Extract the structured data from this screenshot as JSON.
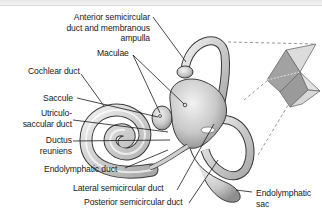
{
  "figure": {
    "labels": {
      "anterior": [
        "Anterior semicircular",
        "duct and membranous",
        "ampulla"
      ],
      "maculae": "Maculae",
      "cochlear_duct": "Cochlear duct",
      "saccule": "Saccule",
      "utriculo": [
        "Utriculo-",
        "saccular duct"
      ],
      "ductus": [
        "Ductus",
        "reuniens"
      ],
      "endolymphatic_duct": "Endolymphatic duct",
      "lateral": "Lateral semicircular duct",
      "posterior": "Posterior semicircular duct",
      "endolymphatic_sac": [
        "Endolymphatic",
        "sac"
      ]
    },
    "colors": {
      "structure_fill": "#c8c8c8",
      "structure_stroke": "#3a3a3a",
      "plane_dark": "#9a9a9a",
      "plane_light": "#d6d6d6",
      "leader_line": "#1a1a1a",
      "dash_line": "#888888"
    }
  }
}
